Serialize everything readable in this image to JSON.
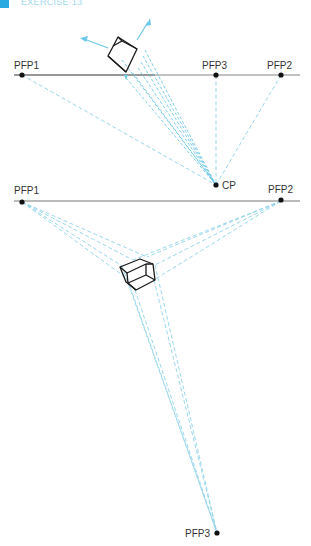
{
  "header": {
    "title": "EXERCISE 13"
  },
  "colors": {
    "accent": "#29abe2",
    "guide": "#8fd3ea",
    "ink": "#1a1a1a"
  },
  "top_figure": {
    "points": {
      "pfp1": "PFP1",
      "pfp3": "PFP3",
      "pfp2": "PFP2",
      "cp": "CP"
    }
  },
  "bottom_figure": {
    "points": {
      "pfp1": "PFP1",
      "pfp2": "PFP2",
      "pfp3": "PFP3"
    }
  }
}
